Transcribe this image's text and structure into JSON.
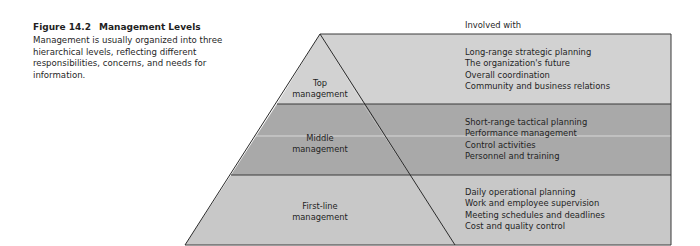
{
  "figure": {
    "number": "Figure 14.2",
    "title": "Management Levels",
    "description": "Management is usually organized into three hierarchical levels, reflecting different responsibilities, concerns, and needs for information."
  },
  "column_header": "Involved with",
  "colors": {
    "top": "#d2d2d2",
    "middle": "#a9a9a9",
    "first_line": "#c8c8c8",
    "outline": "#3a3a3a"
  },
  "levels": [
    {
      "label_line1": "Top",
      "label_line2": "management",
      "responsibilities": [
        "Long-range strategic planning",
        "The organization's future",
        "Overall coordination",
        "Community and business relations"
      ]
    },
    {
      "label_line1": "Middle",
      "label_line2": "management",
      "responsibilities": [
        "Short-range tactical planning",
        "Performance management",
        "Control activities",
        "Personnel and training"
      ]
    },
    {
      "label_line1": "First-line",
      "label_line2": "management",
      "responsibilities": [
        "Daily operational planning",
        "Work and employee supervision",
        "Meeting schedules and deadlines",
        "Cost and quality control"
      ]
    }
  ]
}
